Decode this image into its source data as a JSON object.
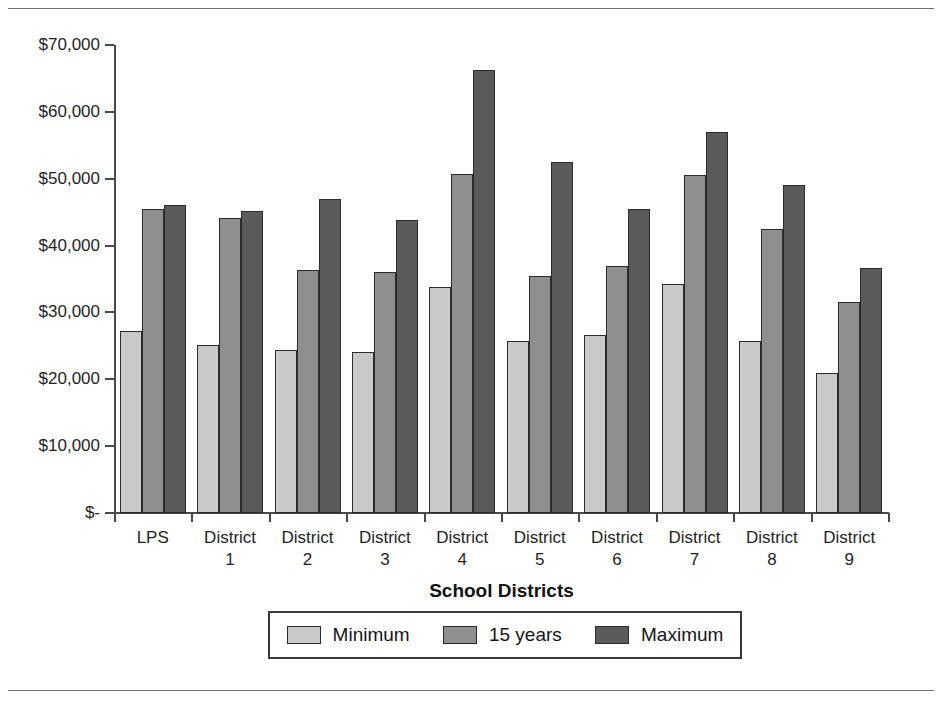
{
  "chart_data": {
    "type": "bar",
    "title": "",
    "xlabel": "School Districts",
    "ylabel": "",
    "ylim": [
      0,
      70000
    ],
    "ytick_values": [
      0,
      10000,
      20000,
      30000,
      40000,
      50000,
      60000,
      70000
    ],
    "ytick_labels": [
      "$-",
      "$10,000",
      "$20,000",
      "$30,000",
      "$40,000",
      "$50,000",
      "$60,000",
      "$70,000"
    ],
    "grid": false,
    "legend_position": "bottom",
    "categories": [
      "LPS",
      "District 1",
      "District 2",
      "District 3",
      "District 4",
      "District 5",
      "District 6",
      "District 7",
      "District 8",
      "District 9"
    ],
    "category_lines": [
      [
        "LPS",
        ""
      ],
      [
        "District",
        "1"
      ],
      [
        "District",
        "2"
      ],
      [
        "District",
        "3"
      ],
      [
        "District",
        "4"
      ],
      [
        "District",
        "5"
      ],
      [
        "District",
        "6"
      ],
      [
        "District",
        "7"
      ],
      [
        "District",
        "8"
      ],
      [
        "District",
        "9"
      ]
    ],
    "series": [
      {
        "name": "Minimum",
        "color": "#c9c9c9",
        "values": [
          27200,
          25100,
          24400,
          24100,
          33800,
          25800,
          26700,
          34200,
          25700,
          21000
        ]
      },
      {
        "name": "15 years",
        "color": "#8f8f8f",
        "values": [
          45400,
          44200,
          36300,
          36000,
          50700,
          35500,
          36900,
          50600,
          42500,
          31600
        ]
      },
      {
        "name": "Maximum",
        "color": "#5a5a5a",
        "values": [
          46100,
          45200,
          47000,
          43800,
          66200,
          52500,
          45500,
          57000,
          49000,
          36700
        ]
      }
    ]
  },
  "legend": {
    "items": [
      {
        "label": "Minimum"
      },
      {
        "label": "15 years"
      },
      {
        "label": "Maximum"
      }
    ]
  }
}
